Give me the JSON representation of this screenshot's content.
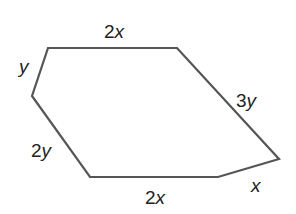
{
  "diagram": {
    "type": "hexagon",
    "stroke_color": "#555555",
    "vertices": [
      [
        48,
        48
      ],
      [
        177,
        48
      ],
      [
        279,
        159
      ],
      [
        218,
        177
      ],
      [
        90,
        177
      ],
      [
        32,
        96
      ]
    ],
    "sides": [
      {
        "id": "top",
        "coef": "2",
        "var": "x"
      },
      {
        "id": "upper-right",
        "coef": "3",
        "var": "y"
      },
      {
        "id": "lower-right",
        "coef": "",
        "var": "x"
      },
      {
        "id": "bottom",
        "coef": "2",
        "var": "x"
      },
      {
        "id": "lower-left",
        "coef": "2",
        "var": "y"
      },
      {
        "id": "upper-left",
        "coef": "",
        "var": "y"
      }
    ]
  }
}
